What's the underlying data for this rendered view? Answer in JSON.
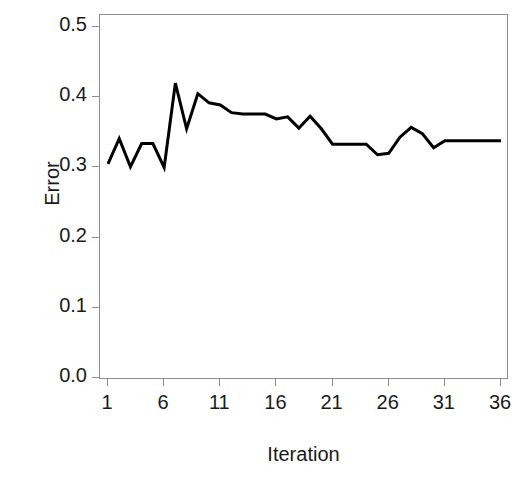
{
  "chart_data": {
    "type": "line",
    "title": "",
    "xlabel": "Iteration",
    "ylabel": "Error",
    "xlim": [
      1,
      36
    ],
    "ylim": [
      0.0,
      0.5
    ],
    "xticks": [
      "1",
      "6",
      "11",
      "16",
      "21",
      "26",
      "31",
      "36"
    ],
    "xtick_values": [
      1,
      6,
      11,
      16,
      21,
      26,
      31,
      36
    ],
    "yticks": [
      "0.0",
      "0.1",
      "0.2",
      "0.3",
      "0.4",
      "0.5"
    ],
    "ytick_values": [
      0.0,
      0.1,
      0.2,
      0.3,
      0.4,
      0.5
    ],
    "grid": false,
    "legend": null,
    "series": [
      {
        "name": "Error",
        "color": "#000000",
        "line_width": 3,
        "x": [
          1,
          2,
          3,
          4,
          5,
          6,
          7,
          8,
          9,
          10,
          11,
          12,
          13,
          14,
          15,
          16,
          17,
          18,
          19,
          20,
          21,
          22,
          23,
          24,
          25,
          26,
          27,
          28,
          29,
          30,
          31,
          32,
          33,
          34,
          35,
          36
        ],
        "values": [
          0.305,
          0.341,
          0.301,
          0.334,
          0.334,
          0.3,
          0.42,
          0.355,
          0.405,
          0.392,
          0.389,
          0.378,
          0.376,
          0.376,
          0.376,
          0.369,
          0.372,
          0.356,
          0.373,
          0.355,
          0.333,
          0.333,
          0.333,
          0.333,
          0.318,
          0.32,
          0.343,
          0.357,
          0.348,
          0.328,
          0.338,
          0.338,
          0.338,
          0.338,
          0.338,
          0.338
        ]
      }
    ]
  },
  "axes": {
    "ylabel_text": "Error",
    "xlabel_text": "Iteration"
  },
  "title_sliver": {
    "text": ""
  }
}
